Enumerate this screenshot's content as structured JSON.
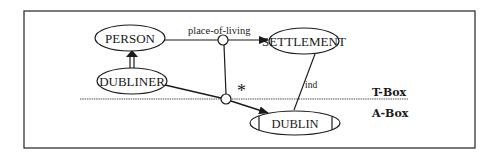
{
  "diagram": {
    "concepts": {
      "person": "PERSON",
      "dubliner": "DUBLINER",
      "settlement": "SETTLEMENT"
    },
    "individuals": {
      "dublin": "DUBLIN"
    },
    "roles": {
      "place_of_living": "place-of-living",
      "ind": "ind"
    },
    "markers": {
      "star": "*"
    },
    "layers": {
      "tbox": "T-Box",
      "abox": "A-Box"
    },
    "colors": {
      "stroke": "#1a1a1a",
      "background": "#ffffff"
    }
  }
}
